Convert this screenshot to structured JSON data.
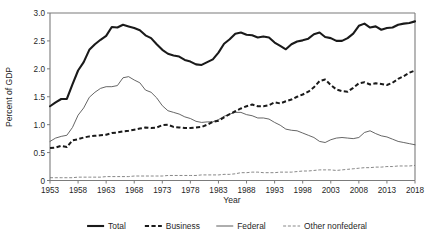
{
  "chart_data": {
    "type": "line",
    "title": "",
    "xlabel": "Year",
    "ylabel": "Percent of GDP",
    "xlim": [
      1953,
      2018
    ],
    "ylim": [
      0,
      3.0
    ],
    "grid": false,
    "legend_position": "bottom",
    "ytick_labels": [
      "0",
      "0.5",
      "1.0",
      "1.5",
      "2.0",
      "2.5",
      "3.0"
    ],
    "ytick_values": [
      0,
      0.5,
      1.0,
      1.5,
      2.0,
      2.5,
      3.0
    ],
    "xtick_labels": [
      "1953",
      "1958",
      "1963",
      "1968",
      "1973",
      "1978",
      "1983",
      "1988",
      "1993",
      "1998",
      "2003",
      "2008",
      "2013",
      "2018"
    ],
    "xtick_values": [
      1953,
      1958,
      1963,
      1968,
      1973,
      1978,
      1983,
      1988,
      1993,
      1998,
      2003,
      2008,
      2013,
      2018
    ],
    "x": [
      1953,
      1954,
      1955,
      1956,
      1957,
      1958,
      1959,
      1960,
      1961,
      1962,
      1963,
      1964,
      1965,
      1966,
      1967,
      1968,
      1969,
      1970,
      1971,
      1972,
      1973,
      1974,
      1975,
      1976,
      1977,
      1978,
      1979,
      1980,
      1981,
      1982,
      1983,
      1984,
      1985,
      1986,
      1987,
      1988,
      1989,
      1990,
      1991,
      1992,
      1993,
      1994,
      1995,
      1996,
      1997,
      1998,
      1999,
      2000,
      2001,
      2002,
      2003,
      2004,
      2005,
      2006,
      2007,
      2008,
      2009,
      2010,
      2011,
      2012,
      2013,
      2014,
      2015,
      2016,
      2017,
      2018
    ],
    "series": [
      {
        "name": "Total",
        "style": "thick-solid",
        "color": "#1a1a1a",
        "values": [
          1.33,
          1.4,
          1.46,
          1.46,
          1.72,
          1.97,
          2.12,
          2.34,
          2.44,
          2.52,
          2.59,
          2.75,
          2.74,
          2.79,
          2.76,
          2.73,
          2.69,
          2.6,
          2.55,
          2.44,
          2.34,
          2.27,
          2.24,
          2.22,
          2.16,
          2.13,
          2.08,
          2.07,
          2.12,
          2.17,
          2.29,
          2.45,
          2.53,
          2.63,
          2.65,
          2.61,
          2.6,
          2.56,
          2.58,
          2.56,
          2.47,
          2.41,
          2.35,
          2.44,
          2.49,
          2.51,
          2.54,
          2.62,
          2.65,
          2.57,
          2.55,
          2.5,
          2.5,
          2.55,
          2.63,
          2.77,
          2.81,
          2.74,
          2.76,
          2.7,
          2.73,
          2.74,
          2.79,
          2.81,
          2.82,
          2.85
        ]
      },
      {
        "name": "Business",
        "style": "thick-dashed",
        "color": "#1a1a1a",
        "values": [
          0.58,
          0.59,
          0.62,
          0.6,
          0.72,
          0.74,
          0.77,
          0.79,
          0.8,
          0.81,
          0.82,
          0.85,
          0.86,
          0.88,
          0.89,
          0.91,
          0.93,
          0.95,
          0.94,
          0.95,
          0.99,
          1.0,
          0.96,
          0.95,
          0.94,
          0.94,
          0.95,
          0.96,
          1.0,
          1.05,
          1.07,
          1.13,
          1.19,
          1.24,
          1.29,
          1.33,
          1.36,
          1.33,
          1.33,
          1.35,
          1.4,
          1.38,
          1.42,
          1.45,
          1.5,
          1.54,
          1.59,
          1.67,
          1.78,
          1.81,
          1.71,
          1.63,
          1.6,
          1.59,
          1.66,
          1.74,
          1.76,
          1.72,
          1.74,
          1.73,
          1.71,
          1.75,
          1.82,
          1.87,
          1.93,
          1.97
        ]
      },
      {
        "name": "Federal",
        "style": "thin-solid",
        "color": "#4a4a4a",
        "values": [
          0.7,
          0.76,
          0.79,
          0.81,
          0.95,
          1.17,
          1.3,
          1.49,
          1.58,
          1.65,
          1.68,
          1.68,
          1.7,
          1.84,
          1.86,
          1.8,
          1.75,
          1.62,
          1.58,
          1.48,
          1.34,
          1.25,
          1.22,
          1.19,
          1.14,
          1.11,
          1.06,
          1.04,
          1.05,
          1.05,
          1.09,
          1.15,
          1.19,
          1.22,
          1.22,
          1.18,
          1.16,
          1.12,
          1.12,
          1.1,
          1.04,
          0.99,
          0.92,
          0.9,
          0.89,
          0.85,
          0.81,
          0.77,
          0.7,
          0.68,
          0.73,
          0.76,
          0.77,
          0.76,
          0.75,
          0.77,
          0.86,
          0.89,
          0.84,
          0.8,
          0.78,
          0.74,
          0.7,
          0.68,
          0.66,
          0.64
        ]
      },
      {
        "name": "Other nonfederal",
        "style": "thin-dashed",
        "color": "#6a6a6a",
        "values": [
          0.05,
          0.05,
          0.05,
          0.05,
          0.05,
          0.06,
          0.06,
          0.06,
          0.06,
          0.06,
          0.07,
          0.07,
          0.07,
          0.07,
          0.07,
          0.08,
          0.08,
          0.08,
          0.08,
          0.08,
          0.08,
          0.09,
          0.09,
          0.09,
          0.09,
          0.09,
          0.09,
          0.1,
          0.1,
          0.1,
          0.1,
          0.11,
          0.11,
          0.12,
          0.14,
          0.14,
          0.15,
          0.15,
          0.14,
          0.14,
          0.14,
          0.15,
          0.15,
          0.15,
          0.16,
          0.17,
          0.17,
          0.18,
          0.19,
          0.19,
          0.19,
          0.18,
          0.19,
          0.2,
          0.21,
          0.22,
          0.23,
          0.23,
          0.24,
          0.24,
          0.25,
          0.25,
          0.26,
          0.26,
          0.26,
          0.27
        ]
      }
    ]
  },
  "legend": {
    "items": [
      {
        "label": "Total",
        "style": "thick-solid"
      },
      {
        "label": "Business",
        "style": "thick-dashed"
      },
      {
        "label": "Federal",
        "style": "thin-solid"
      },
      {
        "label": "Other nonfederal",
        "style": "thin-dashed"
      }
    ]
  }
}
